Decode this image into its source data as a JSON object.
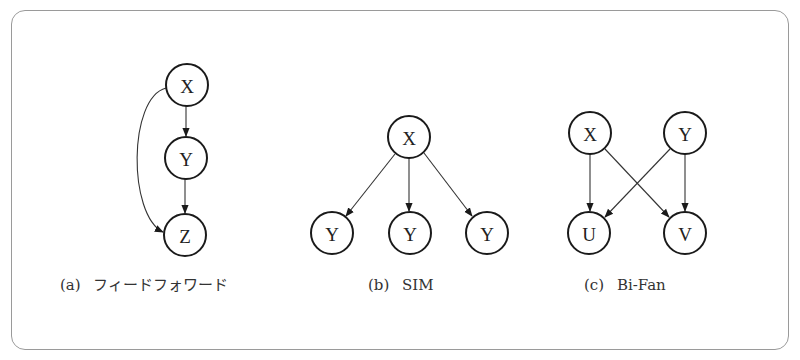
{
  "figure": {
    "panels": [
      {
        "id": "a",
        "caption_label": "(a)",
        "caption_title": "フィードフォワード",
        "nodes": [
          {
            "id": "X",
            "label": "X",
            "cx": 187,
            "cy": 85
          },
          {
            "id": "Y",
            "label": "Y",
            "cx": 186,
            "cy": 158
          },
          {
            "id": "Z",
            "label": "Z",
            "cx": 185,
            "cy": 235
          }
        ],
        "edges": [
          {
            "from": "X",
            "to": "Y"
          },
          {
            "from": "Y",
            "to": "Z"
          },
          {
            "from": "X",
            "to": "Z",
            "curved": true
          }
        ]
      },
      {
        "id": "b",
        "caption_label": "(b)",
        "caption_title": "SIM",
        "nodes": [
          {
            "id": "X",
            "label": "X",
            "cx": 409,
            "cy": 137
          },
          {
            "id": "Y1",
            "label": "Y",
            "cx": 332,
            "cy": 233
          },
          {
            "id": "Y2",
            "label": "Y",
            "cx": 410,
            "cy": 233
          },
          {
            "id": "Y3",
            "label": "Y",
            "cx": 487,
            "cy": 233
          }
        ],
        "edges": [
          {
            "from": "X",
            "to": "Y1"
          },
          {
            "from": "X",
            "to": "Y2"
          },
          {
            "from": "X",
            "to": "Y3"
          }
        ]
      },
      {
        "id": "c",
        "caption_label": "(c)",
        "caption_title": "Bi-Fan",
        "nodes": [
          {
            "id": "X",
            "label": "X",
            "cx": 590,
            "cy": 133
          },
          {
            "id": "Y",
            "label": "Y",
            "cx": 685,
            "cy": 133
          },
          {
            "id": "U",
            "label": "U",
            "cx": 589,
            "cy": 233
          },
          {
            "id": "V",
            "label": "V",
            "cx": 685,
            "cy": 233
          }
        ],
        "edges": [
          {
            "from": "X",
            "to": "U"
          },
          {
            "from": "X",
            "to": "V"
          },
          {
            "from": "Y",
            "to": "U"
          },
          {
            "from": "Y",
            "to": "V"
          }
        ]
      }
    ]
  }
}
